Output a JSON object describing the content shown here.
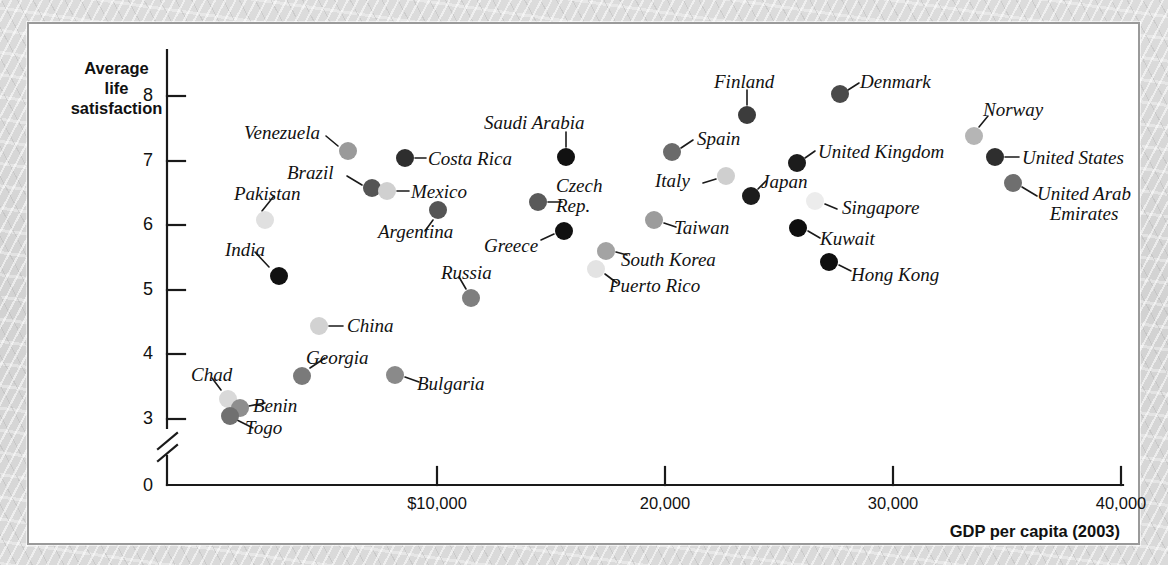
{
  "chart_data": {
    "type": "scatter",
    "title": "",
    "xlabel": "GDP per capita (2003)",
    "ylabel": "Average life satisfaction",
    "ylabel_lines": [
      "Average",
      "life",
      "satisfaction"
    ],
    "xtick_labels": [
      "0",
      "$10,000",
      "20,000",
      "30,000",
      "40,000"
    ],
    "xtick_values": [
      0,
      10000,
      20000,
      30000,
      40000
    ],
    "ytick_labels": [
      "0",
      "3",
      "4",
      "5",
      "6",
      "7",
      "8"
    ],
    "ytick_values": [
      0,
      3,
      4,
      5,
      6,
      7,
      8
    ],
    "xlim": [
      0,
      44000
    ],
    "ylim": [
      2.6,
      8.4
    ],
    "y_axis_break": true,
    "grid": false,
    "legend": "none",
    "points": [
      {
        "name": "Chad",
        "x": 1300,
        "y": 3.45,
        "color": "#d9d9d9",
        "px": 199,
        "py": 375,
        "lx": 162,
        "ly": 341,
        "anchor": "start",
        "leader": [
          [
            192,
            366
          ],
          [
            183,
            354
          ]
        ]
      },
      {
        "name": "Benin",
        "x": 1800,
        "y": 3.3,
        "color": "#8e8e8e",
        "px": 211,
        "py": 384,
        "lx": 224,
        "ly": 372,
        "anchor": "start",
        "leader": [
          [
            220,
            382
          ],
          [
            236,
            379
          ]
        ]
      },
      {
        "name": "Togo",
        "x": 1450,
        "y": 3.18,
        "color": "#707070",
        "px": 201,
        "py": 392,
        "lx": 216,
        "ly": 394,
        "anchor": "start",
        "leader": [
          [
            208,
            396
          ],
          [
            224,
            404
          ]
        ]
      },
      {
        "name": "India",
        "x": 2800,
        "y": 5.3,
        "color": "#111111",
        "px": 250,
        "py": 252,
        "lx": 196,
        "ly": 216,
        "anchor": "start",
        "leader": [
          [
            240,
            243
          ],
          [
            226,
            228
          ]
        ]
      },
      {
        "name": "Pakistan",
        "x": 2100,
        "y": 6.05,
        "color": "#e0e0e0",
        "px": 236,
        "py": 196,
        "lx": 205,
        "ly": 160,
        "anchor": "start",
        "leader": [
          [
            233,
            187
          ],
          [
            245,
            172
          ]
        ]
      },
      {
        "name": "China",
        "x": 4700,
        "y": 4.55,
        "color": "#d2d2d2",
        "px": 290,
        "py": 302,
        "lx": 318,
        "ly": 292,
        "anchor": "start",
        "leader": [
          [
            300,
            302
          ],
          [
            314,
            302
          ]
        ]
      },
      {
        "name": "Georgia",
        "x": 4300,
        "y": 3.77,
        "color": "#7a7a7a",
        "px": 273,
        "py": 352,
        "lx": 277,
        "ly": 324,
        "anchor": "start",
        "leader": [
          [
            281,
            344
          ],
          [
            296,
            334
          ]
        ]
      },
      {
        "name": "Bulgaria",
        "x": 8300,
        "y": 3.8,
        "color": "#8a8a8a",
        "px": 366,
        "py": 351,
        "lx": 388,
        "ly": 350,
        "anchor": "start",
        "leader": [
          [
            376,
            353
          ],
          [
            390,
            358
          ]
        ]
      },
      {
        "name": "Venezuela",
        "x": 6300,
        "y": 7.15,
        "color": "#9a9a9a",
        "px": 319,
        "py": 127,
        "lx": 215,
        "ly": 99,
        "anchor": "start",
        "leader": [
          [
            309,
            122
          ],
          [
            297,
            112
          ]
        ]
      },
      {
        "name": "Brazil",
        "x": 8000,
        "y": 6.65,
        "color": "#555555",
        "px": 343,
        "py": 164,
        "lx": 258,
        "ly": 139,
        "anchor": "start",
        "leader": [
          [
            333,
            161
          ],
          [
            318,
            152
          ]
        ]
      },
      {
        "name": "Mexico",
        "x": 9100,
        "y": 6.57,
        "color": "#d0d0d0",
        "px": 358,
        "py": 167,
        "lx": 382,
        "ly": 158,
        "anchor": "start",
        "leader": [
          [
            368,
            167
          ],
          [
            380,
            167
          ]
        ]
      },
      {
        "name": "Costa Rica",
        "x": 9300,
        "y": 7.0,
        "color": "#2e2e2e",
        "px": 376,
        "py": 134,
        "lx": 399,
        "ly": 125,
        "anchor": "start",
        "leader": [
          [
            386,
            134
          ],
          [
            397,
            134
          ]
        ]
      },
      {
        "name": "Argentina",
        "x": 11500,
        "y": 6.28,
        "color": "#555555",
        "px": 409,
        "py": 186,
        "lx": 349,
        "ly": 198,
        "anchor": "start",
        "leader": [
          [
            404,
            196
          ],
          [
            396,
            207
          ]
        ]
      },
      {
        "name": "Russia",
        "x": 11800,
        "y": 4.95,
        "color": "#7f7f7f",
        "px": 442,
        "py": 274,
        "lx": 412,
        "ly": 239,
        "anchor": "start",
        "leader": [
          [
            437,
            265
          ],
          [
            430,
            253
          ]
        ]
      },
      {
        "name": "Saudi Arabia",
        "x": 15900,
        "y": 7.03,
        "color": "#111111",
        "px": 537,
        "py": 133,
        "lx": 455,
        "ly": 89,
        "anchor": "start",
        "leader": [
          [
            537,
            123
          ],
          [
            537,
            108
          ]
        ]
      },
      {
        "name": "Czech Rep.",
        "x": 15400,
        "y": 6.38,
        "color": "#5a5a5a",
        "px": 509,
        "py": 178,
        "lx": 527,
        "ly": 152,
        "anchor": "start",
        "leader": [
          [
            519,
            178
          ],
          [
            533,
            178
          ]
        ]
      },
      {
        "name": "Greece",
        "x": 15900,
        "y": 5.99,
        "color": "#111111",
        "px": 535,
        "py": 207,
        "lx": 455,
        "ly": 212,
        "anchor": "start",
        "leader": [
          [
            525,
            210
          ],
          [
            512,
            216
          ]
        ]
      },
      {
        "name": "South Korea",
        "x": 17500,
        "y": 5.67,
        "color": "#a3a3a3",
        "px": 577,
        "py": 227,
        "lx": 592,
        "ly": 226,
        "anchor": "start",
        "leader": [
          [
            587,
            228
          ],
          [
            598,
            231
          ]
        ]
      },
      {
        "name": "Puerto Rico",
        "x": 17300,
        "y": 5.38,
        "color": "#e3e3e3",
        "px": 567,
        "py": 245,
        "lx": 580,
        "ly": 252,
        "anchor": "start",
        "leader": [
          [
            576,
            250
          ],
          [
            588,
            259
          ]
        ]
      },
      {
        "name": "Taiwan",
        "x": 20900,
        "y": 6.13,
        "color": "#9c9c9c",
        "px": 625,
        "py": 196,
        "lx": 645,
        "ly": 194,
        "anchor": "start",
        "leader": [
          [
            635,
            199
          ],
          [
            647,
            203
          ]
        ]
      },
      {
        "name": "Spain",
        "x": 20700,
        "y": 7.13,
        "color": "#6b6b6b",
        "px": 643,
        "py": 128,
        "lx": 668,
        "ly": 105,
        "anchor": "start",
        "leader": [
          [
            652,
            124
          ],
          [
            664,
            116
          ]
        ]
      },
      {
        "name": "Italy",
        "x": 23100,
        "y": 6.79,
        "color": "#cfcfcf",
        "px": 697,
        "py": 152,
        "lx": 626,
        "ly": 147,
        "anchor": "start",
        "leader": [
          [
            687,
            155
          ],
          [
            674,
            159
          ]
        ]
      },
      {
        "name": "Finland",
        "x": 24000,
        "y": 7.68,
        "color": "#3c3c3c",
        "px": 718,
        "py": 91,
        "lx": 685,
        "ly": 48,
        "anchor": "start",
        "leader": [
          [
            718,
            81
          ],
          [
            718,
            66
          ]
        ]
      },
      {
        "name": "Japan",
        "x": 24300,
        "y": 6.48,
        "color": "#1c1c1c",
        "px": 722,
        "py": 172,
        "lx": 732,
        "ly": 148,
        "anchor": "start",
        "leader": [
          [
            729,
            165
          ],
          [
            737,
            157
          ]
        ]
      },
      {
        "name": "United Kingdom",
        "x": 26400,
        "y": 6.95,
        "color": "#1c1c1c",
        "px": 768,
        "py": 139,
        "lx": 789,
        "ly": 118,
        "anchor": "start",
        "leader": [
          [
            776,
            134
          ],
          [
            786,
            127
          ]
        ]
      },
      {
        "name": "Singapore",
        "x": 27600,
        "y": 6.38,
        "color": "#ececec",
        "px": 786,
        "py": 177,
        "lx": 813,
        "ly": 174,
        "anchor": "start",
        "leader": [
          [
            796,
            180
          ],
          [
            808,
            185
          ]
        ]
      },
      {
        "name": "Kuwait",
        "x": 26200,
        "y": 6.03,
        "color": "#0f0f0f",
        "px": 769,
        "py": 204,
        "lx": 791,
        "ly": 205,
        "anchor": "start",
        "leader": [
          [
            779,
            207
          ],
          [
            791,
            214
          ]
        ]
      },
      {
        "name": "Hong Kong",
        "x": 27900,
        "y": 5.48,
        "color": "#0f0f0f",
        "px": 800,
        "py": 238,
        "lx": 822,
        "ly": 241,
        "anchor": "start",
        "leader": [
          [
            810,
            241
          ],
          [
            822,
            247
          ]
        ]
      },
      {
        "name": "Denmark",
        "x": 28300,
        "y": 8.0,
        "color": "#4a4a4a",
        "px": 811,
        "py": 70,
        "lx": 831,
        "ly": 48,
        "anchor": "start",
        "leader": [
          [
            819,
            66
          ],
          [
            830,
            59
          ]
        ]
      },
      {
        "name": "Norway",
        "x": 34200,
        "y": 7.4,
        "color": "#b5b5b5",
        "px": 945,
        "py": 112,
        "lx": 954,
        "ly": 76,
        "anchor": "start",
        "leader": [
          [
            950,
            103
          ],
          [
            959,
            92
          ]
        ]
      },
      {
        "name": "United States",
        "x": 35500,
        "y": 7.1,
        "color": "#2e2e2e",
        "px": 966,
        "py": 133,
        "lx": 993,
        "ly": 124,
        "anchor": "start",
        "leader": [
          [
            976,
            133
          ],
          [
            990,
            133
          ]
        ]
      },
      {
        "name": "United Arab Emirates",
        "x": 36000,
        "y": 6.65,
        "color": "#6f6f6f",
        "px": 984,
        "py": 159,
        "lx": 1008,
        "ly": 160,
        "anchor": "start",
        "leader": [
          [
            993,
            163
          ],
          [
            1008,
            172
          ]
        ],
        "two_line": true,
        "line1": "United Arab",
        "line2": "Emirates"
      }
    ]
  }
}
